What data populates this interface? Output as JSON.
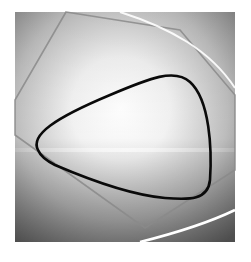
{
  "image": {
    "description": "Abstract grayscale render: a square panel with radial light gradient, a thin gray polygon outline, a thick black rounded-triangle curve, and white light-streak arcs",
    "background": "#ffffff",
    "panel": {
      "x": 15,
      "y": 12,
      "width": 220,
      "height": 230
    },
    "colors": {
      "panel_light": "#ffffff",
      "panel_mid": "#c8c8c8",
      "panel_dark": "#6e6e6e",
      "polygon_stroke": "#8a8a8a",
      "curve_stroke": "#0a0a0a",
      "streak": "#ffffff"
    },
    "shapes": {
      "polygon": {
        "points": "66,12 180,30 235,95 235,170 145,228 15,135 15,100"
      },
      "rounded_triangle": {
        "path": "M 38,150 C 30,135 55,118 110,95 C 150,78 175,68 190,82 C 210,100 212,150 210,180 C 208,200 190,200 165,198 C 130,195 90,180 55,165 C 45,160 40,155 38,150 Z"
      },
      "streak_top": {
        "path": "M 120,12 C 170,28 210,50 235,88"
      },
      "streak_bottom": {
        "path": "M 140,242 C 180,232 210,222 235,210"
      },
      "horizon_band_y": 150
    }
  }
}
